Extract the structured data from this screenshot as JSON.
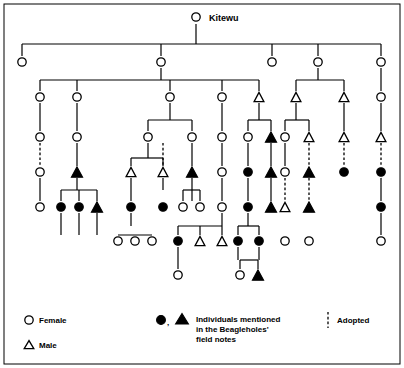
{
  "figure": {
    "title": "Kitewu",
    "apex": {
      "label": "Kitewu",
      "sex": "female",
      "mentioned": false,
      "x": 196,
      "y": 17
    },
    "legend": {
      "female_label": "Female",
      "male_label": "Male",
      "mentioned_label_line1": "Individuals mentioned",
      "mentioned_label_line2": "in the Beagleholes'",
      "mentioned_label_line3": "field notes",
      "adopted_label": "Adopted",
      "female_symbol": "circle-open-icon",
      "male_symbol": "triangle-open-icon",
      "mentioned_symbols": "circle-filled-and-triangle-filled-icon",
      "mentioned_separator": ",",
      "adopted_symbol": "dashed-vertical-line-icon"
    },
    "colors": {
      "ink": "#000000",
      "paper": "#ffffff"
    },
    "generations": [
      {
        "index": 0,
        "y": 17
      },
      {
        "index": 1,
        "y": 62
      },
      {
        "index": 2,
        "y": 97
      },
      {
        "index": 3,
        "y": 137
      },
      {
        "index": 4,
        "y": 172
      },
      {
        "index": 5,
        "y": 207
      },
      {
        "index": 6,
        "y": 241
      },
      {
        "index": 7,
        "y": 275
      }
    ],
    "nodes": [
      {
        "id": "n0",
        "x": 196,
        "y": 17,
        "sex": "female",
        "mentioned": false
      },
      {
        "id": "g1a",
        "x": 22,
        "y": 62,
        "sex": "female",
        "mentioned": false
      },
      {
        "id": "g1b",
        "x": 161,
        "y": 62,
        "sex": "female",
        "mentioned": false
      },
      {
        "id": "g1c",
        "x": 272,
        "y": 62,
        "sex": "female",
        "mentioned": false
      },
      {
        "id": "g1d",
        "x": 318,
        "y": 62,
        "sex": "female",
        "mentioned": false
      },
      {
        "id": "g1e",
        "x": 381,
        "y": 62,
        "sex": "female",
        "mentioned": false
      },
      {
        "id": "g2a",
        "x": 40,
        "y": 97,
        "sex": "female",
        "mentioned": false
      },
      {
        "id": "g2b",
        "x": 77,
        "y": 97,
        "sex": "female",
        "mentioned": false
      },
      {
        "id": "g2c",
        "x": 170,
        "y": 97,
        "sex": "female",
        "mentioned": false
      },
      {
        "id": "g2d",
        "x": 222,
        "y": 97,
        "sex": "female",
        "mentioned": false
      },
      {
        "id": "g2e",
        "x": 259,
        "y": 97,
        "sex": "male",
        "mentioned": false
      },
      {
        "id": "g2f",
        "x": 296,
        "y": 97,
        "sex": "male",
        "mentioned": false
      },
      {
        "id": "g2g",
        "x": 344,
        "y": 97,
        "sex": "male",
        "mentioned": false
      },
      {
        "id": "g2h",
        "x": 381,
        "y": 97,
        "sex": "female",
        "mentioned": false
      },
      {
        "id": "g3a",
        "x": 40,
        "y": 137,
        "sex": "female",
        "mentioned": false
      },
      {
        "id": "g3b",
        "x": 77,
        "y": 137,
        "sex": "female",
        "mentioned": false
      },
      {
        "id": "g3c",
        "x": 148,
        "y": 137,
        "sex": "female",
        "mentioned": false
      },
      {
        "id": "g3d",
        "x": 192,
        "y": 137,
        "sex": "female",
        "mentioned": false
      },
      {
        "id": "g3e",
        "x": 222,
        "y": 137,
        "sex": "female",
        "mentioned": false
      },
      {
        "id": "g3f",
        "x": 248,
        "y": 137,
        "sex": "female",
        "mentioned": false
      },
      {
        "id": "g3g",
        "x": 271,
        "y": 137,
        "sex": "male",
        "mentioned": true
      },
      {
        "id": "g3h",
        "x": 285,
        "y": 137,
        "sex": "female",
        "mentioned": false
      },
      {
        "id": "g3i",
        "x": 309,
        "y": 137,
        "sex": "male",
        "mentioned": false
      },
      {
        "id": "g3j",
        "x": 344,
        "y": 137,
        "sex": "male",
        "mentioned": false
      },
      {
        "id": "g3k",
        "x": 381,
        "y": 137,
        "sex": "male",
        "mentioned": false
      },
      {
        "id": "g4a",
        "x": 40,
        "y": 172,
        "sex": "female",
        "mentioned": false
      },
      {
        "id": "g4b",
        "x": 77,
        "y": 172,
        "sex": "male",
        "mentioned": true
      },
      {
        "id": "g4c",
        "x": 131,
        "y": 172,
        "sex": "male",
        "mentioned": false
      },
      {
        "id": "g4d",
        "x": 163,
        "y": 172,
        "sex": "male",
        "mentioned": false
      },
      {
        "id": "g4e",
        "x": 192,
        "y": 172,
        "sex": "male",
        "mentioned": true
      },
      {
        "id": "g4f",
        "x": 222,
        "y": 172,
        "sex": "female",
        "mentioned": false
      },
      {
        "id": "g4g",
        "x": 248,
        "y": 172,
        "sex": "female",
        "mentioned": true
      },
      {
        "id": "g4h",
        "x": 271,
        "y": 172,
        "sex": "male",
        "mentioned": true
      },
      {
        "id": "g4i",
        "x": 285,
        "y": 172,
        "sex": "female",
        "mentioned": false
      },
      {
        "id": "g4j",
        "x": 309,
        "y": 172,
        "sex": "male",
        "mentioned": true
      },
      {
        "id": "g4k",
        "x": 344,
        "y": 172,
        "sex": "female",
        "mentioned": true
      },
      {
        "id": "g4l",
        "x": 381,
        "y": 172,
        "sex": "female",
        "mentioned": true
      },
      {
        "id": "g5a",
        "x": 40,
        "y": 207,
        "sex": "female",
        "mentioned": false
      },
      {
        "id": "g5b",
        "x": 61,
        "y": 207,
        "sex": "female",
        "mentioned": true
      },
      {
        "id": "g5c",
        "x": 79,
        "y": 207,
        "sex": "female",
        "mentioned": true
      },
      {
        "id": "g5d",
        "x": 97,
        "y": 207,
        "sex": "male",
        "mentioned": true
      },
      {
        "id": "g5e",
        "x": 131,
        "y": 207,
        "sex": "female",
        "mentioned": true
      },
      {
        "id": "g5f",
        "x": 163,
        "y": 207,
        "sex": "female",
        "mentioned": true
      },
      {
        "id": "g5g",
        "x": 183,
        "y": 207,
        "sex": "female",
        "mentioned": false
      },
      {
        "id": "g5h",
        "x": 200,
        "y": 207,
        "sex": "female",
        "mentioned": false
      },
      {
        "id": "g5i",
        "x": 222,
        "y": 207,
        "sex": "female",
        "mentioned": false
      },
      {
        "id": "g5j",
        "x": 248,
        "y": 207,
        "sex": "female",
        "mentioned": true
      },
      {
        "id": "g5k",
        "x": 271,
        "y": 207,
        "sex": "male",
        "mentioned": true
      },
      {
        "id": "g5l",
        "x": 285,
        "y": 207,
        "sex": "male",
        "mentioned": false
      },
      {
        "id": "g5m",
        "x": 309,
        "y": 207,
        "sex": "male",
        "mentioned": true
      },
      {
        "id": "g5n",
        "x": 381,
        "y": 207,
        "sex": "female",
        "mentioned": true
      },
      {
        "id": "g6a",
        "x": 118,
        "y": 241,
        "sex": "female",
        "mentioned": false
      },
      {
        "id": "g6b",
        "x": 135,
        "y": 241,
        "sex": "female",
        "mentioned": false
      },
      {
        "id": "g6c",
        "x": 152,
        "y": 241,
        "sex": "female",
        "mentioned": false
      },
      {
        "id": "g6d",
        "x": 178,
        "y": 241,
        "sex": "female",
        "mentioned": true
      },
      {
        "id": "g6e",
        "x": 200,
        "y": 241,
        "sex": "male",
        "mentioned": false
      },
      {
        "id": "g6f",
        "x": 222,
        "y": 241,
        "sex": "male",
        "mentioned": false
      },
      {
        "id": "g6g",
        "x": 238,
        "y": 241,
        "sex": "female",
        "mentioned": true
      },
      {
        "id": "g6h",
        "x": 259,
        "y": 241,
        "sex": "female",
        "mentioned": true
      },
      {
        "id": "g6i",
        "x": 285,
        "y": 241,
        "sex": "female",
        "mentioned": false
      },
      {
        "id": "g6j",
        "x": 309,
        "y": 241,
        "sex": "female",
        "mentioned": false
      },
      {
        "id": "g6k",
        "x": 381,
        "y": 241,
        "sex": "female",
        "mentioned": false
      },
      {
        "id": "g7a",
        "x": 178,
        "y": 275,
        "sex": "female",
        "mentioned": false
      },
      {
        "id": "g7b",
        "x": 240,
        "y": 275,
        "sex": "female",
        "mentioned": false
      },
      {
        "id": "g7c",
        "x": 258,
        "y": 275,
        "sex": "male",
        "mentioned": true
      }
    ],
    "solid_paths": [
      "M196,24 L196,44",
      "M22,44 L381,44",
      "M22,44 L22,56",
      "M161,44 L161,56",
      "M272,44 L272,56",
      "M318,44 L318,56",
      "M381,44 L381,56",
      "M161,68 L161,80",
      "M40,80 L259,80",
      "M40,80 L40,91",
      "M77,80 L77,91",
      "M170,80 L170,91",
      "M222,80 L222,91",
      "M259,80 L259,91",
      "M318,68 L318,80",
      "M296,80 L344,80",
      "M296,80 L296,91",
      "M344,80 L344,91",
      "M381,68 L381,91",
      "M40,103 L40,131",
      "M77,103 L77,131",
      "M170,103 L170,120",
      "M148,120 L192,120",
      "M148,120 L148,131",
      "M192,120 L192,131",
      "M222,103 L222,131",
      "M259,103 L259,120",
      "M248,120 L271,120",
      "M248,120 L248,131",
      "M271,120 L271,131",
      "M296,103 L296,120",
      "M285,120 L309,120",
      "M285,120 L285,131",
      "M309,120 L309,131",
      "M344,103 L344,131",
      "M381,103 L381,131",
      "M77,143 L77,166",
      "M148,143 L148,158",
      "M131,158 L163,158",
      "M131,158 L131,166",
      "M163,158 L163,166",
      "M192,143 L192,166",
      "M222,143 L222,166",
      "M248,143 L248,166",
      "M271,143 L271,166",
      "M285,143 L285,166",
      "M40,178 L40,201",
      "M77,178 L77,190",
      "M61,190 L97,190",
      "M61,190 L61,201",
      "M79,190 L79,201",
      "M97,190 L97,201",
      "M131,178 L131,201",
      "M163,178 L163,190",
      "M183,190 L200,190",
      "M183,190 L183,201",
      "M200,190 L200,201",
      "M192,178 L192,201",
      "M222,178 L222,201",
      "M248,178 L248,201",
      "M271,178 L271,201",
      "M381,178 L381,201",
      "M61,213 L61,235",
      "M79,213 L79,235",
      "M97,213 L97,235",
      "M118,235 L152,235",
      "M118,235 L118,235",
      "M131,213 L131,226",
      "M178,226 L222,226",
      "M178,226 L178,235",
      "M200,226 L200,235",
      "M222,226 L222,235",
      "M131,226 L131,226",
      "M222,213 L222,226",
      "M238,226 L259,226",
      "M238,226 L238,235",
      "M259,226 L259,235",
      "M248,213 L248,226",
      "M381,213 L381,235",
      "M178,247 L178,269",
      "M238,247 L238,260",
      "M259,247 L259,260",
      "M240,260 L258,260",
      "M240,260 L240,269",
      "M258,260 L258,269"
    ],
    "dashed_paths": [
      "M40,143 L40,166",
      "M163,143 L163,166",
      "M309,143 L309,166",
      "M344,143 L344,166",
      "M381,143 L381,166",
      "M285,178 L285,201",
      "M309,178 L309,201",
      "M381,178 L381,178"
    ],
    "frame": {
      "x": 4,
      "y": 4,
      "width": 396,
      "height": 360
    }
  }
}
